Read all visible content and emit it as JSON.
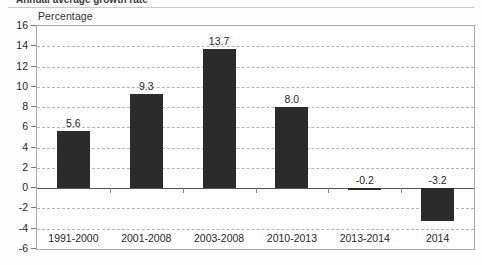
{
  "title_partial": "Annual average growth rate",
  "axis_title": "Percentage",
  "colors": {
    "bar": "#2b2b2b",
    "grid": "#b4b4b4",
    "zero": "#555555",
    "border": "#a9a9a9",
    "text": "#1f1f1f"
  },
  "chart_data": {
    "type": "bar",
    "title": "",
    "xlabel": "",
    "ylabel": "Percentage",
    "ylim": [
      -6,
      16
    ],
    "ystep": 2,
    "grid": true,
    "legend": "none",
    "categories": [
      "1991-2000",
      "2001-2008",
      "2003-2008",
      "2010-2013",
      "2013-2014",
      "2014"
    ],
    "values": [
      5.6,
      9.3,
      13.7,
      8.0,
      -0.2,
      -3.2
    ],
    "value_labels": [
      "5.6",
      "9.3",
      "13.7",
      "8.0",
      "-0.2",
      "-3.2"
    ],
    "ticks": [
      "16",
      "14",
      "12",
      "10",
      "8",
      "6",
      "4",
      "2",
      "0",
      "-2",
      "-4",
      "-6"
    ]
  }
}
